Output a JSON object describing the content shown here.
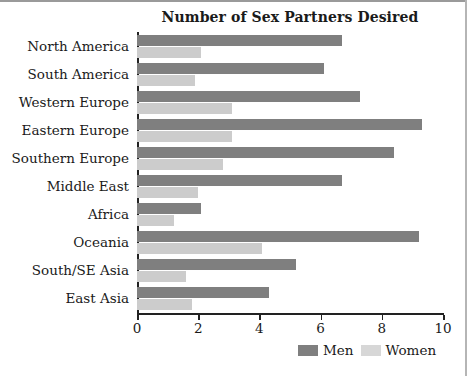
{
  "chart_data": {
    "type": "bar",
    "orientation": "horizontal",
    "title": "Number of Sex Partners Desired",
    "xlabel": "",
    "ylabel": "",
    "xlim": [
      0,
      10
    ],
    "xticks": [
      0,
      2,
      4,
      6,
      8,
      10
    ],
    "xtick_labels": [
      "0",
      "2",
      "4",
      "6",
      "8",
      "10"
    ],
    "grid": false,
    "legend_position": "bottom-right",
    "categories": [
      "North America",
      "South America",
      "Western Europe",
      "Eastern Europe",
      "Southern Europe",
      "Middle East",
      "Africa",
      "Oceania",
      "South/SE Asia",
      "East Asia"
    ],
    "series": [
      {
        "name": "Men",
        "color": "#7f7f7f",
        "values": [
          6.7,
          6.1,
          7.3,
          9.3,
          8.4,
          6.7,
          2.1,
          9.2,
          5.2,
          4.3
        ]
      },
      {
        "name": "Women",
        "color": "#cccccc",
        "values": [
          2.1,
          1.9,
          3.1,
          3.1,
          2.8,
          2.0,
          1.2,
          4.1,
          1.6,
          1.8
        ]
      }
    ]
  },
  "legend": {
    "entries": [
      {
        "label": "Men",
        "swatch": "men-swatch"
      },
      {
        "label": "Women",
        "swatch": "women-swatch"
      }
    ]
  }
}
